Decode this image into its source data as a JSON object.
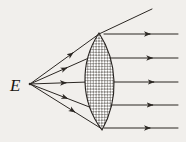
{
  "figure": {
    "type": "ray-optics-diagram",
    "width": 186,
    "height": 142,
    "background_color": "#f1efec",
    "ink_color": "#2b2723",
    "labels": {
      "source": "E"
    },
    "source_point": {
      "x": 30,
      "y": 84
    },
    "lens": {
      "name": "biconvex-lens",
      "top_vertex": {
        "x": 99,
        "y": 33
      },
      "bottom_vertex": {
        "x": 102,
        "y": 130
      },
      "left_edge_x": 85,
      "right_edge_x": 114,
      "widest_y": 81,
      "fill_pattern": "crosshatch",
      "fill_color": "#8f8c87",
      "outline_color": "#272320"
    },
    "incident_rays": [
      {
        "name": "incident-ray-1",
        "x1": 30,
        "y1": 84,
        "x2": 99,
        "y2": 34,
        "arrow_t": 0.62
      },
      {
        "name": "incident-ray-2",
        "x1": 30,
        "y1": 84,
        "x2": 91,
        "y2": 57,
        "arrow_t": 0.6
      },
      {
        "name": "incident-ray-3",
        "x1": 30,
        "y1": 84,
        "x2": 88,
        "y2": 82,
        "arrow_t": 0.62
      },
      {
        "name": "incident-ray-4",
        "x1": 30,
        "y1": 84,
        "x2": 92,
        "y2": 108,
        "arrow_t": 0.6
      },
      {
        "name": "incident-ray-5",
        "x1": 30,
        "y1": 84,
        "x2": 102,
        "y2": 129,
        "arrow_t": 0.62
      }
    ],
    "emergent_rays": [
      {
        "name": "emergent-ray-1",
        "x1": 104,
        "y1": 34,
        "x2": 178,
        "y2": 34,
        "arrow_t": 0.62
      },
      {
        "name": "emergent-ray-2",
        "x1": 110,
        "y1": 58,
        "x2": 178,
        "y2": 58,
        "arrow_t": 0.62
      },
      {
        "name": "emergent-ray-3",
        "x1": 114,
        "y1": 82,
        "x2": 178,
        "y2": 82,
        "arrow_t": 0.62
      },
      {
        "name": "emergent-ray-4",
        "x1": 111,
        "y1": 105,
        "x2": 178,
        "y2": 105,
        "arrow_t": 0.62
      },
      {
        "name": "emergent-ray-5",
        "x1": 104,
        "y1": 128,
        "x2": 178,
        "y2": 128,
        "arrow_t": 0.62
      }
    ],
    "oblique_ray": {
      "name": "oblique-ray-top",
      "x1": 99,
      "y1": 34,
      "x2": 152,
      "y2": 9
    }
  }
}
